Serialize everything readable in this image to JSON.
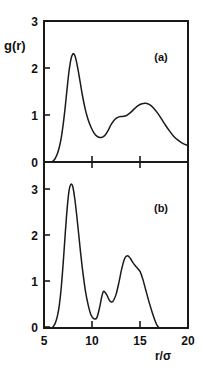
{
  "figure": {
    "ylabel": "g(r)",
    "xlabel_numerator": "r",
    "xlabel_slash": "/",
    "xlabel_denominator": "σ",
    "xlabel": "r/σ",
    "line_color": "#1a1a1a",
    "background": "#ffffff"
  },
  "panel_a": {
    "tag": "(a)",
    "ytick_labels": [
      "0",
      "1",
      "2",
      "3"
    ]
  },
  "panel_b": {
    "tag": "(b)",
    "ytick_labels": [
      "0",
      "1",
      "2",
      "3"
    ],
    "xtick_labels": [
      "5",
      "10",
      "15",
      "20"
    ]
  },
  "chart_data": [
    {
      "type": "line",
      "title": "(a)",
      "xlabel": "r/σ",
      "ylabel": "g(r)",
      "xlim": [
        5,
        20
      ],
      "ylim": [
        0,
        3
      ],
      "xticks": [
        5,
        10,
        15,
        20
      ],
      "yticks": [
        0,
        1,
        2,
        3
      ],
      "grid": false,
      "legend": "none",
      "series": [
        {
          "name": "g(r) panel a",
          "x": [
            5.0,
            5.5,
            5.8,
            6.0,
            6.2,
            6.4,
            6.6,
            6.8,
            7.0,
            7.2,
            7.4,
            7.6,
            7.8,
            8.0,
            8.2,
            8.4,
            8.6,
            8.8,
            9.0,
            9.3,
            9.6,
            9.9,
            10.2,
            10.5,
            10.8,
            11.1,
            11.4,
            11.7,
            12.0,
            12.4,
            12.8,
            13.2,
            13.6,
            14.0,
            14.4,
            14.8,
            15.2,
            15.6,
            16.0,
            16.4,
            16.8,
            17.2,
            17.6,
            18.0,
            18.5,
            19.0,
            19.5,
            20.0
          ],
          "y": [
            0.0,
            0.0,
            0.0,
            0.03,
            0.09,
            0.18,
            0.32,
            0.52,
            0.8,
            1.15,
            1.55,
            1.92,
            2.18,
            2.3,
            2.27,
            2.12,
            1.9,
            1.66,
            1.42,
            1.12,
            0.9,
            0.74,
            0.62,
            0.55,
            0.52,
            0.53,
            0.58,
            0.68,
            0.8,
            0.91,
            0.96,
            0.97,
            0.99,
            1.05,
            1.13,
            1.2,
            1.24,
            1.25,
            1.22,
            1.15,
            1.05,
            0.93,
            0.8,
            0.68,
            0.55,
            0.46,
            0.39,
            0.35
          ]
        }
      ]
    },
    {
      "type": "line",
      "title": "(b)",
      "xlabel": "r/σ",
      "ylabel": "g(r)",
      "xlim": [
        5,
        20
      ],
      "ylim": [
        0,
        3
      ],
      "xticks": [
        5,
        10,
        15,
        20
      ],
      "yticks": [
        0,
        1,
        2,
        3
      ],
      "grid": false,
      "legend": "none",
      "series": [
        {
          "name": "g(r) panel b",
          "x": [
            5.0,
            5.5,
            5.8,
            6.0,
            6.2,
            6.4,
            6.6,
            6.8,
            7.0,
            7.2,
            7.4,
            7.6,
            7.8,
            8.0,
            8.2,
            8.4,
            8.6,
            8.8,
            9.0,
            9.3,
            9.6,
            9.9,
            10.2,
            10.5,
            10.8,
            11.0,
            11.2,
            11.5,
            11.8,
            12.0,
            12.2,
            12.5,
            12.8,
            13.1,
            13.4,
            13.7,
            14.0,
            14.3,
            14.6,
            15.0,
            15.3,
            15.6,
            16.0,
            16.3,
            16.6,
            16.8,
            17.0
          ],
          "y": [
            0.0,
            0.0,
            0.0,
            0.04,
            0.12,
            0.26,
            0.5,
            0.88,
            1.4,
            2.0,
            2.55,
            2.95,
            3.1,
            3.05,
            2.8,
            2.45,
            2.05,
            1.65,
            1.28,
            0.82,
            0.5,
            0.28,
            0.2,
            0.22,
            0.45,
            0.66,
            0.79,
            0.73,
            0.6,
            0.56,
            0.58,
            0.72,
            0.98,
            1.28,
            1.5,
            1.56,
            1.5,
            1.4,
            1.32,
            1.22,
            1.05,
            0.82,
            0.52,
            0.32,
            0.14,
            0.05,
            0.0
          ]
        }
      ]
    }
  ]
}
